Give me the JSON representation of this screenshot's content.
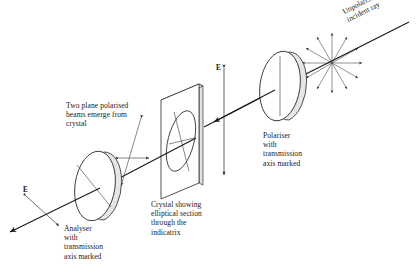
{
  "figure": {
    "kind": "optics-diagram",
    "background_color": "#ffffff",
    "stroke_color": "#1a1a1a",
    "fill_color": "#f2f2f2"
  },
  "labels": {
    "incident_ray": "Unpolarised\nincident ray",
    "polariser": "Polariser\nwith\ntransmission\naxis marked",
    "crystal": "Crystal showing\nelliptical section\nthrough the\nindicatrix",
    "analyser": "Analyser\nwith\ntransmission\naxis marked",
    "emergent_beams": "Two plane polarised\nbeams emerge from\ncrystal",
    "e_vector_middle": "E",
    "e_vector_left": "E"
  },
  "components": {
    "starburst": {
      "name": "unpolarised-vibration-starburst",
      "center_x": 332,
      "center_y": 63,
      "ray_count": 12,
      "radius": 30
    },
    "polariser_disc": {
      "name": "polariser-disc",
      "center_x": 280,
      "center_y": 86,
      "rx": 20,
      "ry": 35,
      "transmission_axis": "vertical"
    },
    "crystal_plate": {
      "name": "crystal-plate",
      "center_x": 186,
      "center_y": 133,
      "indicatrix_axes": 2
    },
    "analyser_disc": {
      "name": "analyser-disc",
      "center_x": 95,
      "center_y": 186,
      "rx": 20,
      "ry": 35,
      "transmission_axis": "diagonal"
    },
    "ray_path": {
      "name": "light-ray-path",
      "direction": "upper-right to lower-left",
      "arrowheads": 3
    }
  }
}
